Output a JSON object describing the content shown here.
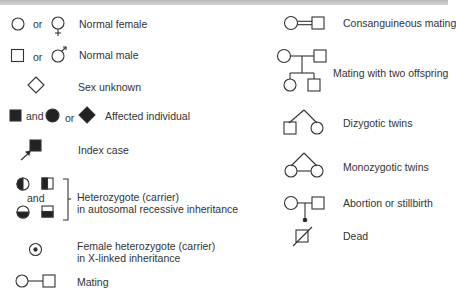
{
  "legend": {
    "left": [
      {
        "id": "normal_female",
        "label": "Normal female",
        "conjunction": "or"
      },
      {
        "id": "normal_male",
        "label": "Normal male",
        "conjunction": "or"
      },
      {
        "id": "sex_unknown",
        "label": "Sex unknown"
      },
      {
        "id": "affected",
        "label": "Affected individual",
        "conjunctions": [
          "and",
          "or"
        ]
      },
      {
        "id": "index_case",
        "label": "Index case"
      },
      {
        "id": "heterozygote_ar",
        "label_line1": "Heterozygote (carrier)",
        "label_line2": "in autosomal recessive inheritance",
        "conjunction": "and"
      },
      {
        "id": "female_heterozygote_xl",
        "label_line1": "Female heterozygote (carrier)",
        "label_line2": "in X-linked inheritance"
      },
      {
        "id": "mating",
        "label": "Mating"
      }
    ],
    "right": [
      {
        "id": "consanguineous_mating",
        "label": "Consanguineous mating"
      },
      {
        "id": "mating_two_offspring",
        "label": "Mating with two offspring"
      },
      {
        "id": "dizygotic_twins",
        "label": "Dizygotic twins"
      },
      {
        "id": "monozygotic_twins",
        "label": "Monozygotic twins"
      },
      {
        "id": "abortion_stillbirth",
        "label": "Abortion or stillbirth"
      },
      {
        "id": "dead",
        "label": "Dead"
      }
    ]
  },
  "colors": {
    "stroke": "#333333",
    "fill": "#222222",
    "band": "#c4c4c4"
  }
}
